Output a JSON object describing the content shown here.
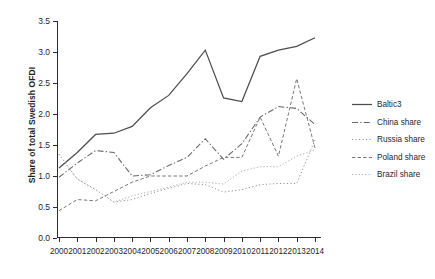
{
  "chart_data": {
    "type": "line",
    "title": "",
    "xlabel": "",
    "ylabel": "Share of total Swedish OFDI",
    "x": [
      2000,
      2001,
      2002,
      2003,
      2004,
      2005,
      2006,
      2007,
      2008,
      2009,
      2010,
      2011,
      2012,
      2013,
      2014
    ],
    "xlim": [
      2000,
      2014
    ],
    "ylim": [
      0.0,
      3.5
    ],
    "yticks": [
      "0.0",
      "0.5",
      "1.0",
      "1.5",
      "2.0",
      "2.5",
      "3.0",
      "3.5"
    ],
    "xticks": [
      "2000",
      "2001",
      "2002",
      "2003",
      "2004",
      "2005",
      "2006",
      "2007",
      "2008",
      "2009",
      "2010",
      "2011",
      "2012",
      "2013",
      "2014"
    ],
    "grid": false,
    "legend_position": "right",
    "series": [
      {
        "name": "Baltic3",
        "style": "solid",
        "color": "#4d4d4d",
        "values": [
          1.13,
          1.38,
          1.67,
          1.69,
          1.8,
          2.1,
          2.3,
          2.65,
          3.03,
          2.26,
          2.2,
          2.93,
          3.03,
          3.09,
          3.23
        ]
      },
      {
        "name": "China share",
        "style": "dash-dot",
        "color": "#666666",
        "values": [
          0.98,
          1.21,
          1.41,
          1.38,
          1.0,
          1.02,
          1.17,
          1.3,
          1.6,
          1.27,
          1.52,
          1.95,
          2.12,
          2.09,
          1.83
        ]
      },
      {
        "name": "Russia share",
        "style": "dotted-fine",
        "color": "#8c8c8c",
        "values": [
          1.35,
          0.95,
          0.78,
          0.58,
          0.62,
          0.72,
          0.8,
          0.88,
          0.86,
          0.74,
          0.78,
          0.86,
          0.88,
          0.88,
          1.58
        ]
      },
      {
        "name": "Poland share",
        "style": "dashed",
        "color": "#777777",
        "values": [
          0.44,
          0.62,
          0.6,
          0.75,
          0.9,
          1.0,
          1.0,
          1.0,
          1.16,
          1.3,
          1.3,
          1.95,
          1.32,
          2.57,
          1.45
        ]
      },
      {
        "name": "Brazil share",
        "style": "dotted",
        "color": "#b3b3b3",
        "values": [
          1.35,
          0.95,
          0.78,
          0.58,
          0.68,
          0.75,
          0.82,
          0.9,
          0.9,
          0.87,
          1.08,
          1.15,
          1.15,
          1.32,
          1.42
        ]
      }
    ]
  },
  "legend": {
    "items": [
      {
        "label": "Baltic3"
      },
      {
        "label": "China share"
      },
      {
        "label": "Russia share"
      },
      {
        "label": "Poland share"
      },
      {
        "label": "Brazil share"
      }
    ]
  }
}
